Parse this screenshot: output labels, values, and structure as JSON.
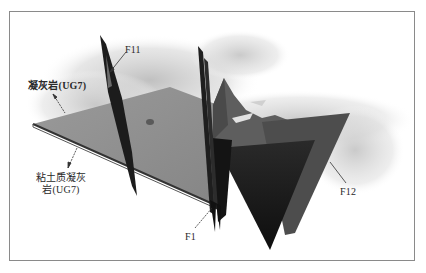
{
  "figure": {
    "colors": {
      "frame": "#8a8a8a",
      "plane_tuff": "#8f8f8f",
      "plane_edge": "#3a3a3a",
      "fault_dark": "#1a1a1a",
      "fault_mid": "#4a4a4a",
      "surface_haze": "#cfcfcf",
      "background": "#ffffff"
    },
    "labels": {
      "tuff": "凝灰岩(UG7)",
      "clay_tuff": "粘土质凝灰岩(UG7)",
      "fault_f11": "F11",
      "fault_f1": "F1",
      "fault_f12": "F12"
    },
    "elements": [
      {
        "name": "tuff-plane",
        "label": "凝灰岩(UG7)"
      },
      {
        "name": "clay-tuff-plane",
        "label": "粘土质凝灰岩(UG7)"
      },
      {
        "name": "fault-f11",
        "label": "F11"
      },
      {
        "name": "fault-f1",
        "label": "F1"
      },
      {
        "name": "fault-f12",
        "label": "F12"
      }
    ]
  }
}
